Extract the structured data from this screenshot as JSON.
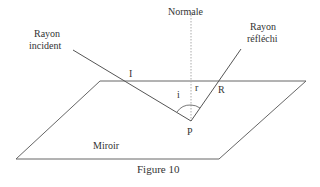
{
  "labels": {
    "normal": "Normale",
    "incident_ray_line1": "Rayon",
    "incident_ray_line2": "incident",
    "reflected_ray_line1": "Rayon",
    "reflected_ray_line2": "réfléchi",
    "point_I": "I",
    "point_R": "R",
    "point_P": "P",
    "angle_i": "i",
    "angle_r": "r",
    "mirror": "Miroir",
    "caption": "Figure 10"
  },
  "colors": {
    "line": "#555555",
    "normal": "#aaaaaa",
    "text": "#333333"
  }
}
